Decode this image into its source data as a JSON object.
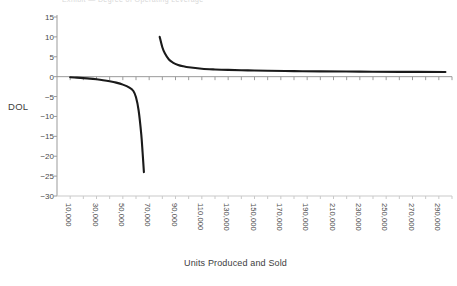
{
  "chart_data": {
    "type": "line",
    "title": "",
    "xlabel": "Units Produced and Sold",
    "ylabel": "DOL",
    "ylim": [
      -30,
      15
    ],
    "xlim": [
      0,
      300000
    ],
    "grid": false,
    "legend": "none",
    "y_ticks": [
      "15",
      "10",
      "5",
      "0",
      "-5",
      "-10",
      "-15",
      "-20",
      "-25",
      "-30"
    ],
    "y_tick_values": [
      15,
      10,
      5,
      0,
      -5,
      -10,
      -15,
      -20,
      -25,
      -30
    ],
    "x_ticks": [
      "10,000",
      "30,000",
      "50,000",
      "70,000",
      "90,000",
      "110,000",
      "130,000",
      "150,000",
      "170,000",
      "190,000",
      "210,000",
      "230,000",
      "250,000",
      "270,000",
      "290,000"
    ],
    "x_tick_values": [
      10000,
      30000,
      50000,
      70000,
      90000,
      110000,
      130000,
      150000,
      170000,
      190000,
      210000,
      230000,
      250000,
      270000,
      290000
    ],
    "x_minor_step": 10000,
    "asymptote_x": 75000,
    "series": [
      {
        "name": "DOL below break-even",
        "color": "#1a1a1a",
        "x": [
          10000,
          15000,
          20000,
          25000,
          30000,
          35000,
          40000,
          45000,
          50000,
          55000,
          58000,
          60000,
          62000,
          64000,
          65000,
          66000
        ],
        "values": [
          -0.15,
          -0.25,
          -0.37,
          -0.5,
          -0.67,
          -0.88,
          -1.15,
          -1.5,
          -2.0,
          -2.75,
          -3.6,
          -5.2,
          -8.5,
          -14.5,
          -19.0,
          -24.0
        ]
      },
      {
        "name": "DOL above break-even",
        "color": "#1a1a1a",
        "x": [
          78000,
          80000,
          82000,
          85000,
          88000,
          92000,
          96000,
          100000,
          110000,
          120000,
          130000,
          145000,
          160000,
          180000,
          200000,
          230000,
          260000,
          295000
        ],
        "values": [
          10.0,
          7.4,
          5.8,
          4.3,
          3.55,
          2.95,
          2.6,
          2.35,
          2.0,
          1.82,
          1.7,
          1.58,
          1.48,
          1.4,
          1.33,
          1.26,
          1.21,
          1.17
        ]
      }
    ]
  },
  "axes": {
    "y_axis_label": "DOL",
    "x_axis_label": "Units Produced and Sold"
  },
  "title_ghost": "Exhibit — Degree of Operating Leverage"
}
